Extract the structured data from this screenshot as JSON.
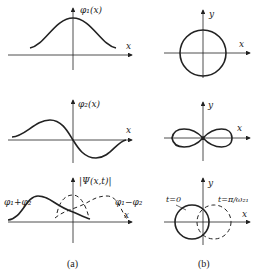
{
  "column_a": {
    "caption": "(a)",
    "panel1": {
      "y_label": "φ₁(x)",
      "x_label": "x"
    },
    "panel2": {
      "y_label": "φ₂(x)",
      "x_label": "x"
    },
    "panel3": {
      "y_label": "|Ψ(x,t)|",
      "x_label": "x",
      "curve_sum_label": "φ₁+φ₂",
      "curve_diff_label": "φ₁−φ₂"
    }
  },
  "column_b": {
    "caption": "(b)",
    "panel1": {
      "y_label": "y",
      "x_label": "x"
    },
    "panel2": {
      "y_label": "y",
      "x_label": "x"
    },
    "panel3": {
      "y_label": "y",
      "x_label": "x",
      "t0_label": "t=0",
      "t1_label": "t=π/ω₂₁"
    }
  },
  "colors": {
    "ink": "#222222",
    "background": "#ffffff"
  }
}
